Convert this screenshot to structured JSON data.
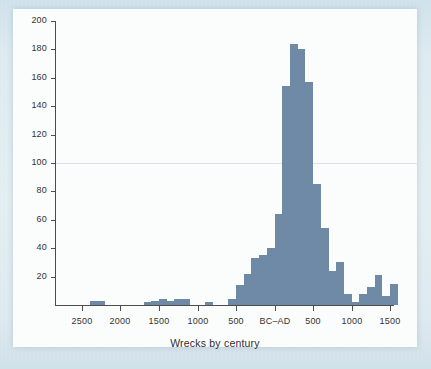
{
  "figure": {
    "paper_color": "#fdfefe",
    "background_color": "#d7e6ed",
    "bar_color": "#6d88a4",
    "axis_color": "#4a4a4a",
    "gridline_color": "#dfe2e4"
  },
  "chart_data": {
    "type": "bar",
    "title": "",
    "subtitle": "",
    "xlabel": "Wrecks by century",
    "ylabel": "",
    "grid": "single horizontal line at y=100",
    "legend": "none",
    "ylim": [
      0,
      200
    ],
    "y_ticks": [
      20,
      40,
      60,
      80,
      100,
      120,
      140,
      160,
      180,
      200
    ],
    "y_tick_labels": [
      "20",
      "40",
      "60",
      "80",
      "100",
      "120",
      "140",
      "160",
      "180",
      "200"
    ],
    "x_tick_positions": [
      -2500,
      -2000,
      -1500,
      -1000,
      -500,
      0,
      500,
      1000,
      1500
    ],
    "x_tick_labels": [
      "2500",
      "2000",
      "1500",
      "1000",
      "500",
      "BC–AD",
      "500",
      "1000",
      "1500"
    ],
    "xlim": [
      -2850,
      1550
    ],
    "bin_width": 100,
    "x_note": "Bin left edges in years; negative = BC, positive = AD",
    "categories": [
      "-2800",
      "-2700",
      "-2600",
      "-2500",
      "-2400",
      "-2300",
      "-2200",
      "-2100",
      "-2000",
      "-1900",
      "-1800",
      "-1700",
      "-1600",
      "-1500",
      "-1400",
      "-1300",
      "-1200",
      "-1100",
      "-1000",
      "-900",
      "-800",
      "-700",
      "-600",
      "-500",
      "-400",
      "-300",
      "-200",
      "-100",
      "0",
      "100",
      "200",
      "300",
      "400",
      "500",
      "600",
      "700",
      "800",
      "900",
      "1000",
      "1100",
      "1200",
      "1300",
      "1400",
      "1500"
    ],
    "values": [
      0,
      0,
      0,
      0,
      3,
      3,
      0,
      0,
      0,
      0,
      0,
      2,
      3,
      4,
      3,
      4,
      4,
      0,
      0,
      2,
      0,
      0,
      4,
      14,
      22,
      33,
      35,
      40,
      64,
      154,
      184,
      180,
      157,
      85,
      54,
      24,
      30,
      8,
      2,
      8,
      13,
      21,
      6,
      15
    ]
  },
  "axis_title": {
    "text": "Wrecks by century"
  }
}
